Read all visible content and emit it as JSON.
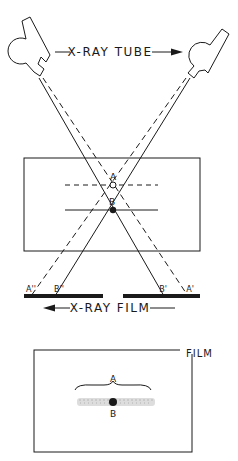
{
  "diagram": {
    "top_label": "X-RAY TUBE",
    "bottom_label": "X-RAY FILM",
    "film_view_label": "FILM",
    "point_a": "A",
    "point_b": "B",
    "left_film_labels": {
      "a": "A''",
      "b": "B''"
    },
    "right_film_labels": {
      "b": "B'",
      "a": "A'"
    },
    "film_view_points": {
      "a": "A",
      "b": "B"
    },
    "colors": {
      "ink": "#1a1a1a",
      "blur": "#bdbdbd",
      "background": "#ffffff"
    }
  }
}
